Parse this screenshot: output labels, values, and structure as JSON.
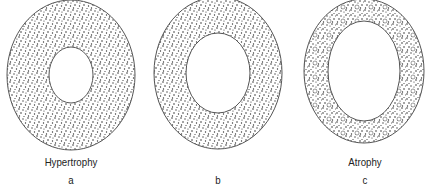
{
  "diagram": {
    "panels": [
      {
        "id": "a",
        "title": "Hypertrophy",
        "letter": "a",
        "cx": 71,
        "cy": 75,
        "outer_rx": 64,
        "outer_ry": 75,
        "inner_rx": 22,
        "inner_ry": 28,
        "texture": "dense-stipple"
      },
      {
        "id": "b",
        "title": "",
        "letter": "b",
        "cx": 218,
        "cy": 73,
        "outer_rx": 64,
        "outer_ry": 76,
        "inner_rx": 32,
        "inner_ry": 40,
        "texture": "dense-stipple"
      },
      {
        "id": "c",
        "title": "Atrophy",
        "letter": "c",
        "cx": 364,
        "cy": 71,
        "outer_rx": 60,
        "outer_ry": 72,
        "inner_rx": 36,
        "inner_ry": 50,
        "texture": "sparse-stipple-with-vacuoles"
      }
    ],
    "colors": {
      "stroke": "#555555",
      "dots": "#333333",
      "background": "#ffffff",
      "text": "#222222"
    }
  }
}
